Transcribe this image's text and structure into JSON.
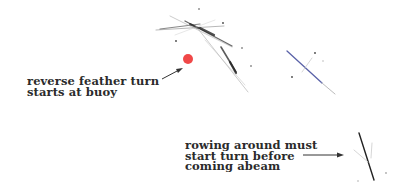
{
  "diagram": {
    "annotations": [
      {
        "id": "buoy",
        "lines": [
          "reverse feather turn",
          "starts at buoy"
        ]
      },
      {
        "id": "abeam",
        "lines": [
          "rowing around must",
          "start turn before",
          "coming abeam"
        ]
      }
    ],
    "buoy": {
      "color": "#f04848"
    },
    "colors": {
      "text": "#2b2b2b",
      "oar_dark": "#333333",
      "oar_blue": "#5a62a8",
      "arrow": "#333333"
    }
  }
}
